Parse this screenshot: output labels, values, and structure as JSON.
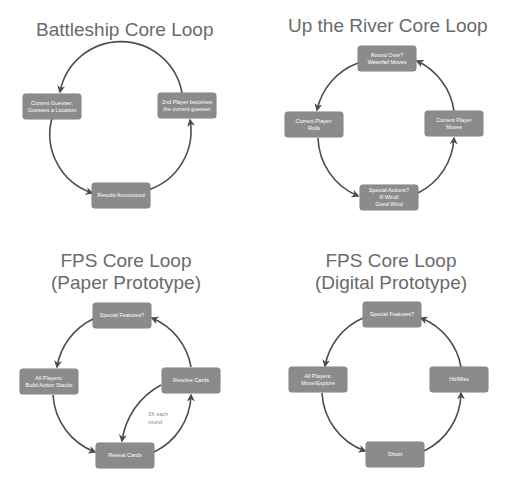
{
  "colors": {
    "box_fill": "#8b8b8b",
    "box_text": "#ffffff",
    "arrow": "#4d4d4d",
    "title": "#6a6a6a"
  },
  "panels": [
    {
      "title": "Battleship Core Loop",
      "nodes": [
        {
          "label": "Current Guesser:\nGuesses a Location"
        },
        {
          "label": "Results Announced"
        },
        {
          "label": "2nd Player becomes\nthe current guesser"
        }
      ]
    },
    {
      "title": "Up the River Core Loop",
      "nodes": [
        {
          "label": "Round Over?\nWaterfall Moves"
        },
        {
          "label": "Current Player:\nRolls"
        },
        {
          "label": "Special Actions?\nIll Wind/\nGood Wind"
        },
        {
          "label": "Current Player\nMoves"
        }
      ]
    },
    {
      "title_line1": "FPS Core Loop",
      "title_line2": "(Paper Prototype)",
      "nodes": [
        {
          "label": "Special Features?"
        },
        {
          "label": "All Players:\nBuild Action Stacks"
        },
        {
          "label": "Reveal Cards"
        },
        {
          "label": "Resolve Cards"
        }
      ],
      "note": "3X each\nround"
    },
    {
      "title_line1": "FPS Core Loop",
      "title_line2": "(Digital Prototype)",
      "nodes": [
        {
          "label": "Special Features?"
        },
        {
          "label": "All Players:\nMove/Explore"
        },
        {
          "label": "Shoot"
        },
        {
          "label": "Hit/Miss"
        }
      ]
    }
  ]
}
